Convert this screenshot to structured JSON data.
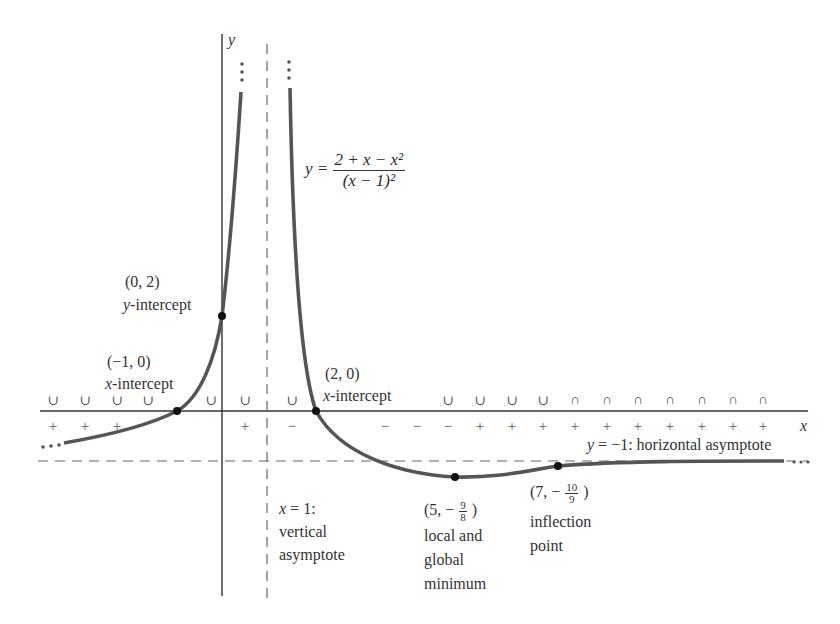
{
  "chart_data": {
    "type": "line",
    "title": "",
    "function": "y = (2 + x - x^2) / (x - 1)^2",
    "xlabel": "x",
    "ylabel": "y",
    "grid": false,
    "asymptotes": {
      "vertical": {
        "x": 1,
        "label_line1": "x = 1:",
        "label_line2": "vertical",
        "label_line3": "asymptote"
      },
      "horizontal": {
        "y": -1,
        "label": "y = −1: horizontal asymptote"
      }
    },
    "points": [
      {
        "x": -1,
        "y": 0,
        "coord": "(−1, 0)",
        "label": "x-intercept"
      },
      {
        "x": 0,
        "y": 2,
        "coord": "(0, 2)",
        "label": "y-intercept"
      },
      {
        "x": 2,
        "y": 0,
        "coord": "(2, 0)",
        "label": "x-intercept"
      },
      {
        "x": 5,
        "y": -1.125,
        "coord": "(5, − 9/8)",
        "label": "local and global minimum"
      },
      {
        "x": 7,
        "y": -1.1111,
        "coord": "(7, − 10/9)",
        "label": "inflection point"
      }
    ],
    "concavity_row": [
      "∪",
      "∪",
      "∪",
      "∪",
      "∪",
      "∪",
      "∪",
      "∪",
      "∪",
      "∪",
      "∪",
      "∩",
      "∩",
      "∩",
      "∩",
      "∩",
      "∩",
      "∩"
    ],
    "sign_row": [
      "+",
      "+",
      "+",
      "+",
      "−",
      "−",
      "−",
      "−",
      "−",
      "+",
      "+",
      "+",
      "+",
      "+",
      "+",
      "+",
      "+",
      "+",
      "+",
      "+"
    ]
  },
  "labels": {
    "y_axis": "y",
    "x_axis": "x",
    "equation_lhs": "y =",
    "equation_num": "2 + x − x²",
    "equation_den": "(x − 1)²",
    "p0_coord": "(0, 2)",
    "p0_y": "y",
    "p0_text": "-intercept",
    "pm1_coord": "(−1, 0)",
    "pm1_x": "x",
    "pm1_text": "-intercept",
    "p2_coord": "(2, 0)",
    "p2_x": "x",
    "p2_text": "-intercept",
    "hasym_y": "y",
    "hasym_rest": " = −1: horizontal asymptote",
    "vasym_x": "x",
    "vasym_rest": " = 1:",
    "vasym_l2": "vertical",
    "vasym_l3": "asymptote",
    "min_coord_a": "(5, −",
    "min_num": "9",
    "min_den": "8",
    "min_coord_b": ")",
    "min_l1": "local and",
    "min_l2": "global",
    "min_l3": "minimum",
    "inf_coord_a": "(7, −",
    "inf_num": "10",
    "inf_den": "9",
    "inf_coord_b": ")",
    "inf_l1": "inflection",
    "inf_l2": "point",
    "ellipsis": "…"
  },
  "colors": {
    "curve": "#555555",
    "axis": "#333333",
    "dashed": "#666666",
    "point": "#111111"
  }
}
